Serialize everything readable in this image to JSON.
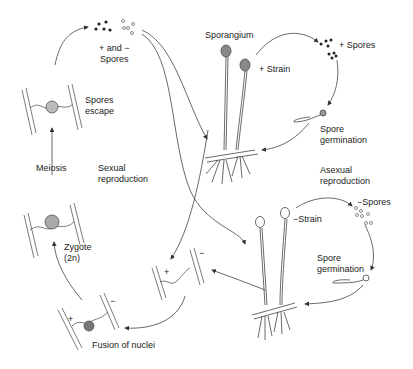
{
  "diagram": {
    "type": "life-cycle",
    "labels": {
      "plus_minus_spores": "+ and −\nSpores",
      "spores_escape": "Spores\nescape",
      "meiosis": "Meiosis",
      "sexual_reproduction": "Sexual\nreproduction",
      "zygote": "Zygote\n(2n)",
      "fusion_of_nuclei": "Fusion of nuclei",
      "sporangium": "Sporangium",
      "plus_strain": "+ Strain",
      "plus_spores": "+ Spores",
      "spore_germination_top": "Spore\ngermination",
      "asexual_reproduction": "Asexual\nreproduction",
      "minus_strain": "−Strain",
      "minus_spores": "−Spores",
      "spore_germination_bottom": "Spore\ngermination",
      "plus_sign_conjugation": "+",
      "minus_sign_conjugation": "−",
      "plus_sign_fusion": "+",
      "minus_sign_fusion": "−"
    },
    "stages": [
      "+ and − spores",
      "Spores escape",
      "Meiosis",
      "Zygote (2n)",
      "Fusion of nuclei",
      "Hyphae conjugation (+ / −)",
      "+ Strain sporangia",
      "+ Spores",
      "Spore germination",
      "− Strain sporangia",
      "− Spores",
      "Spore germination"
    ],
    "colors": {
      "ink": "#333333",
      "background": "#ffffff"
    }
  }
}
